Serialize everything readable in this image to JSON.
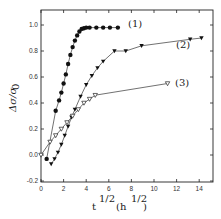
{
  "chart_data": {
    "type": "scatter",
    "title": "",
    "xlabel": "t^1/2 (h^1/2)",
    "ylabel": "Δσ/σ0",
    "xlim": [
      0,
      15
    ],
    "ylim": [
      -0.2,
      1.1
    ],
    "xticks": [
      0,
      2,
      4,
      6,
      8,
      10,
      12,
      14
    ],
    "yticks": [
      -0.2,
      0.0,
      0.2,
      0.4,
      0.6,
      0.8,
      1.0
    ],
    "xtick_labels": [
      "0",
      "2",
      "4",
      "6",
      "8",
      "10",
      "12",
      "14"
    ],
    "ytick_labels": [
      "-0.2",
      "0.0",
      "0.2",
      "0.4",
      "0.6",
      "0.8",
      "1.0"
    ],
    "grid": false,
    "legend": "inline labels",
    "series": [
      {
        "name": "(1)",
        "marker": "filled-circle",
        "x": [
          0.5,
          1.3,
          1.6,
          1.8,
          2.0,
          2.2,
          2.4,
          2.6,
          2.8,
          3.0,
          3.2,
          3.4,
          3.6,
          3.8,
          4.0,
          4.3,
          4.9,
          5.5,
          6.1,
          6.8
        ],
        "y": [
          -0.03,
          0.34,
          0.42,
          0.48,
          0.55,
          0.62,
          0.7,
          0.77,
          0.83,
          0.88,
          0.92,
          0.95,
          0.97,
          0.975,
          0.98,
          0.98,
          0.98,
          0.98,
          0.98,
          0.98
        ]
      },
      {
        "name": "(2)",
        "marker": "filled-down-triangle",
        "x": [
          0.9,
          1.2,
          1.5,
          1.8,
          2.1,
          2.4,
          2.7,
          3.0,
          3.5,
          4.0,
          4.5,
          5.0,
          5.5,
          6.5,
          7.5,
          8.9,
          13.2,
          14.2
        ],
        "y": [
          -0.07,
          -0.03,
          0.02,
          0.08,
          0.15,
          0.22,
          0.29,
          0.35,
          0.45,
          0.54,
          0.61,
          0.67,
          0.72,
          0.8,
          0.8,
          0.84,
          0.89,
          0.9
        ]
      },
      {
        "name": "(3)",
        "marker": "open-down-triangle",
        "x": [
          0.0,
          0.8,
          1.3,
          1.8,
          2.3,
          2.8,
          3.3,
          3.8,
          4.3,
          4.8,
          11.2
        ],
        "y": [
          0.0,
          0.1,
          0.15,
          0.2,
          0.25,
          0.3,
          0.35,
          0.4,
          0.43,
          0.46,
          0.55
        ]
      }
    ]
  },
  "labels": {
    "s1": "(1)",
    "s2": "(2)",
    "s3": "(3)",
    "x_base": "t",
    "x_exp": "1/2",
    "x_unit_open": "(h",
    "x_unit_exp": "1/2",
    "x_unit_close": ")",
    "y_label": "Δσ/σ",
    "y_sub": "0"
  }
}
